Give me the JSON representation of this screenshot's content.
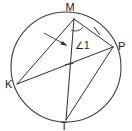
{
  "figure": {
    "type": "circle-geometry-diagram",
    "background_color": "#ffffff",
    "stroke_color": "#2e2e2e",
    "circle_stroke_color": "#3b3b3b",
    "label_color": "#1a1a1a"
  },
  "circle": {
    "center_x": 66,
    "center_y": 67,
    "radius": 55
  },
  "points": [
    {
      "id": "M",
      "label": "M",
      "x": 74,
      "y": 19,
      "label_x": 70,
      "label_y": 10,
      "position": "top"
    },
    {
      "id": "P",
      "label": "P",
      "x": 113,
      "y": 47,
      "label_x": 118,
      "label_y": 50,
      "position": "right"
    },
    {
      "id": "T",
      "label": "T",
      "x": 66,
      "y": 120,
      "label_x": 63,
      "label_y": 130,
      "position": "bottom"
    },
    {
      "id": "K",
      "label": "K",
      "x": 17,
      "y": 84,
      "label_x": 4,
      "label_y": 88,
      "position": "left"
    }
  ],
  "chords": [
    {
      "id": "MK",
      "from": "M",
      "to": "K",
      "label": "MK"
    },
    {
      "id": "MP",
      "from": "M",
      "to": "P",
      "label": "MP"
    },
    {
      "id": "MT",
      "from": "M",
      "to": "T",
      "label": "MT"
    },
    {
      "id": "KP",
      "from": "K",
      "to": "P",
      "label": "KP"
    },
    {
      "id": "PT",
      "from": "P",
      "to": "T",
      "label": "PT"
    }
  ],
  "angle_marks": [
    {
      "id": "angle-1",
      "label": "∠1",
      "vertex": "M",
      "between": [
        "MP",
        "MT"
      ],
      "label_x": 75,
      "label_y": 48
    }
  ],
  "congruence_ticks": [
    {
      "id": "tick-on-MP",
      "on_chord": "MP",
      "count": 1,
      "x": 97,
      "y": 31
    },
    {
      "id": "tick-on-MT",
      "on_chord": "MT",
      "count": 1,
      "x": 69,
      "y": 64
    }
  ],
  "pointers": [
    {
      "id": "pointer-to-angle-M",
      "target": "M",
      "from_x": 44,
      "from_y": 33,
      "to_x": 68,
      "to_y": 46
    }
  ]
}
